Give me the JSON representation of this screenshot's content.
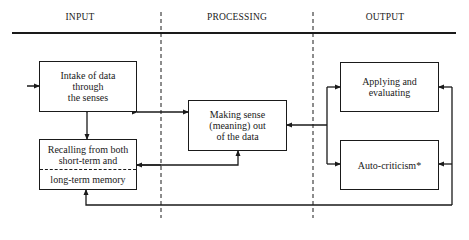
{
  "diagram": {
    "columns": [
      {
        "label": "INPUT"
      },
      {
        "label": "PROCESSING"
      },
      {
        "label": "OUTPUT"
      }
    ],
    "nodes": {
      "intake": {
        "lines": [
          "Intake of data",
          "through",
          "the senses"
        ]
      },
      "memory": {
        "top_lines": [
          "Recalling from both",
          "short-term and"
        ],
        "bottom_line": "long-term memory"
      },
      "sense": {
        "lines": [
          "Making sense",
          "(meaning) out",
          "of the data"
        ]
      },
      "applying": {
        "lines": [
          "Applying and",
          "evaluating"
        ]
      },
      "auto": {
        "lines": [
          "Auto-criticism*"
        ]
      }
    },
    "edges": [
      {
        "from": "external",
        "to": "intake"
      },
      {
        "from": "intake",
        "to": "memory",
        "bidirectional": true
      },
      {
        "from": "intake",
        "to": "sense",
        "bidirectional": true
      },
      {
        "from": "memory",
        "to": "sense"
      },
      {
        "from": "sense",
        "to": "applying"
      },
      {
        "from": "sense",
        "to": "auto"
      },
      {
        "from": "applying",
        "to": "memory"
      },
      {
        "from": "auto",
        "to": "memory"
      }
    ],
    "colors": {
      "ink": "#1a1a1a",
      "background": "#ffffff"
    }
  }
}
